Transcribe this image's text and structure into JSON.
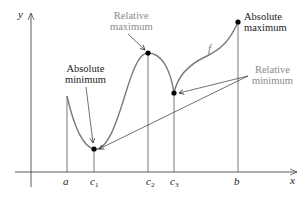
{
  "diagram": {
    "axes": {
      "x_label": "x",
      "y_label": "y"
    },
    "curve_label": "f",
    "x_ticks": [
      {
        "name": "a",
        "base": "a",
        "sub": ""
      },
      {
        "name": "c1",
        "base": "c",
        "sub": "1"
      },
      {
        "name": "c2",
        "base": "c",
        "sub": "2"
      },
      {
        "name": "c3",
        "base": "c",
        "sub": "3"
      },
      {
        "name": "b",
        "base": "b",
        "sub": ""
      }
    ],
    "annotations": {
      "absolute_minimum": {
        "line1": "Absolute",
        "line2": "minimum"
      },
      "relative_maximum": {
        "line1": "Relative",
        "line2": "maximum"
      },
      "absolute_maximum": {
        "line1": "Absolute",
        "line2": "maximum"
      },
      "relative_minimum": {
        "line1": "Relative",
        "line2": "minimum"
      }
    },
    "colors": {
      "curve": "#7a7a7a",
      "axis": "#4a4a4a",
      "dark_text": "#1a1a1a",
      "gray_text": "#8a8a8a",
      "point": "#000000"
    }
  }
}
